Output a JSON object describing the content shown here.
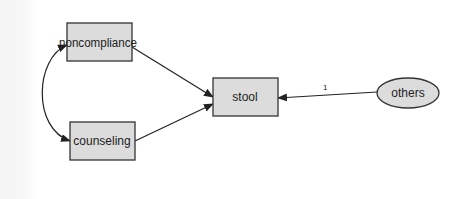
{
  "diagram": {
    "type": "path-diagram",
    "colors": {
      "box_fill": "#dcdcdc",
      "box_stroke": "#333333",
      "ellipse_fill": "#dcdcdc",
      "line": "#222222",
      "background": "#ffffff"
    },
    "nodes": [
      {
        "id": "noncompliance",
        "label": "noncompliance",
        "shape": "rectangle",
        "kind": "observed"
      },
      {
        "id": "counseling",
        "label": "counseling",
        "shape": "rectangle",
        "kind": "observed"
      },
      {
        "id": "stool",
        "label": "stool",
        "shape": "rectangle",
        "kind": "observed"
      },
      {
        "id": "others",
        "label": "others",
        "shape": "ellipse",
        "kind": "unobserved"
      }
    ],
    "edges": [
      {
        "from": "noncompliance",
        "to": "stool",
        "type": "directed",
        "label": ""
      },
      {
        "from": "counseling",
        "to": "stool",
        "type": "directed",
        "label": ""
      },
      {
        "from": "others",
        "to": "stool",
        "type": "directed",
        "label": "1"
      },
      {
        "from": "noncompliance",
        "to": "counseling",
        "type": "covariance",
        "label": ""
      }
    ]
  }
}
